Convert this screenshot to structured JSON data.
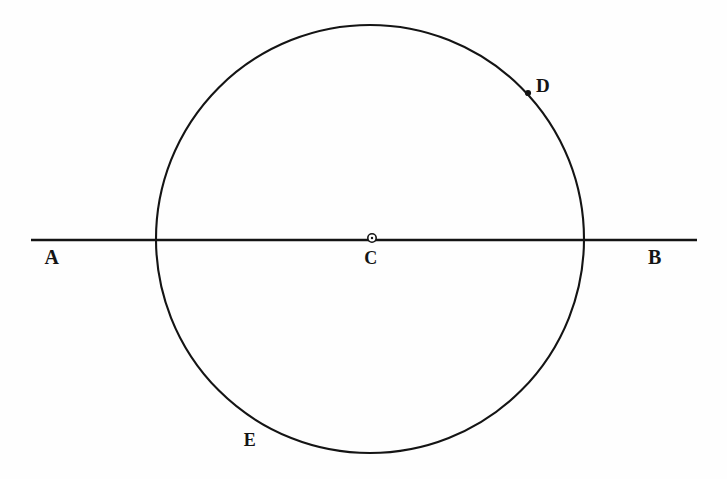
{
  "figure": {
    "background_color": "#fefefe",
    "ink_color": "#141414",
    "canvas": {
      "width": 727,
      "height": 479
    },
    "circle": {
      "center_x": 370,
      "center_y": 239,
      "radius": 214,
      "stroke_width": 2.1
    },
    "diameter_line": {
      "x1": 31,
      "y1": 240,
      "x2": 697,
      "y2": 240,
      "stroke_width": 2.4
    },
    "center_marker": {
      "cx": 372,
      "cy": 238,
      "outer_radius": 4.2,
      "inner_radius": 1.9,
      "fill": "#ffffff",
      "stroke": "#141414"
    },
    "point_marker_d": {
      "cx": 528,
      "cy": 93,
      "radius": 3.1,
      "fill": "#141414"
    },
    "labels": [
      {
        "id": "A",
        "text": "A",
        "x": 52,
        "y": 257,
        "role": "line-endpoint-left"
      },
      {
        "id": "B",
        "text": "B",
        "x": 655,
        "y": 257,
        "role": "line-endpoint-right"
      },
      {
        "id": "C",
        "text": "C",
        "x": 371,
        "y": 258,
        "role": "circle-center"
      },
      {
        "id": "D",
        "text": "D",
        "x": 543,
        "y": 85,
        "role": "point-on-circle-upper-right"
      },
      {
        "id": "E",
        "text": "E",
        "x": 250,
        "y": 440,
        "role": "point-on-circle-lower-left"
      }
    ]
  },
  "chart_data": {
    "type": "diagram",
    "title": "",
    "elements": [
      {
        "kind": "circle",
        "label": "",
        "center": [
          370,
          239
        ],
        "radius": 214
      },
      {
        "kind": "line",
        "label": "AB",
        "from": [
          31,
          240
        ],
        "to": [
          697,
          240
        ]
      },
      {
        "kind": "point",
        "label": "C",
        "at": [
          372,
          238
        ],
        "marker": "open-circle"
      },
      {
        "kind": "point",
        "label": "D",
        "at": [
          528,
          93
        ],
        "marker": "filled-dot"
      },
      {
        "kind": "label",
        "label": "E",
        "at": [
          250,
          440
        ],
        "marker": "none"
      },
      {
        "kind": "label",
        "label": "A",
        "at": [
          52,
          257
        ],
        "marker": "none"
      },
      {
        "kind": "label",
        "label": "B",
        "at": [
          655,
          257
        ],
        "marker": "none"
      }
    ]
  }
}
